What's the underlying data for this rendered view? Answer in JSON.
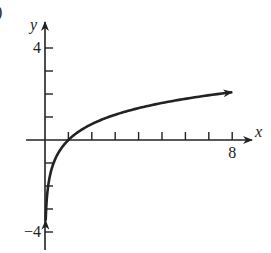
{
  "panel_label": ")",
  "chart_data": {
    "type": "line",
    "title": "",
    "function": "y = ln(x)",
    "xlabel": "x",
    "ylabel": "y",
    "xlim": [
      -0.8,
      8.8
    ],
    "ylim": [
      -4.8,
      5.1
    ],
    "x_ticks": [
      1,
      2,
      3,
      4,
      5,
      6,
      7,
      8
    ],
    "x_tick_labels": {
      "8": "8"
    },
    "y_ticks": [
      -4,
      -3,
      -2,
      -1,
      1,
      2,
      3,
      4
    ],
    "y_tick_labels": {
      "4": "4",
      "-4": "−4"
    },
    "grid": false,
    "legend": null,
    "series": [
      {
        "name": "ln(x)",
        "x": [
          0.03,
          0.05,
          0.1,
          0.2,
          0.3,
          0.5,
          0.75,
          1,
          1.5,
          2,
          3,
          4,
          5,
          6,
          7,
          8
        ],
        "y": [
          -3.51,
          -3.0,
          -2.3,
          -1.61,
          -1.2,
          -0.69,
          -0.29,
          0,
          0.41,
          0.69,
          1.1,
          1.39,
          1.61,
          1.79,
          1.95,
          2.08
        ],
        "arrow_ends": true
      }
    ],
    "colors": {
      "axis": "#222222",
      "curve": "#222222"
    }
  }
}
